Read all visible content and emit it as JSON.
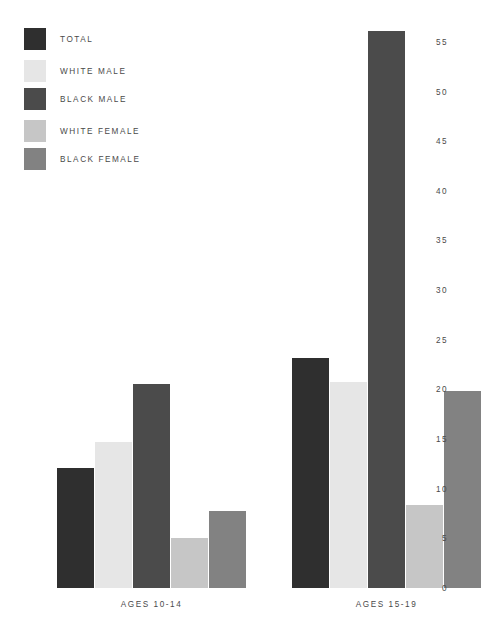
{
  "legend": {
    "items": [
      {
        "label": "TOTAL",
        "color": "#2f2f2f"
      },
      {
        "label": "WHITE MALE",
        "color": "#e6e6e6"
      },
      {
        "label": "BLACK MALE",
        "color": "#4b4b4b"
      },
      {
        "label": "WHITE FEMALE",
        "color": "#c6c6c6"
      },
      {
        "label": "BLACK FEMALE",
        "color": "#828282"
      }
    ]
  },
  "chart_data": {
    "type": "bar",
    "title": "",
    "xlabel": "",
    "ylabel": "",
    "ylim": [
      0,
      57
    ],
    "grid": false,
    "legend_position": "top-left",
    "categories": [
      "AGES 10-14",
      "AGES 15-19"
    ],
    "yticks": [
      "0",
      "5",
      "10",
      "15",
      "20",
      "25",
      "30",
      "35",
      "40",
      "45",
      "50",
      "55"
    ],
    "ytick_values": [
      0,
      5,
      10,
      15,
      20,
      25,
      30,
      35,
      40,
      45,
      50,
      55
    ],
    "series": [
      {
        "name": "TOTAL",
        "color": "#2f2f2f",
        "values": [
          12.1,
          23.2
        ]
      },
      {
        "name": "WHITE MALE",
        "color": "#e6e6e6",
        "values": [
          14.7,
          20.7
        ]
      },
      {
        "name": "BLACK MALE",
        "color": "#4b4b4b",
        "values": [
          20.5,
          56.1
        ]
      },
      {
        "name": "WHITE FEMALE",
        "color": "#c6c6c6",
        "values": [
          5.0,
          8.4
        ]
      },
      {
        "name": "BLACK FEMALE",
        "color": "#828282",
        "values": [
          7.8,
          19.8
        ]
      }
    ]
  }
}
